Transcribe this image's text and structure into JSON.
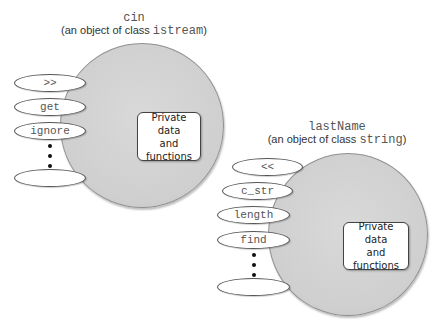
{
  "objects": [
    {
      "name": "cin",
      "subtitle_prefix": "(an object of class ",
      "class_name": "istream",
      "subtitle_suffix": ")",
      "methods": [
        ">>",
        "get",
        "ignore",
        ""
      ],
      "private_label": "Private data\nand\nfunctions"
    },
    {
      "name": "lastName",
      "subtitle_prefix": "(an object of class ",
      "class_name": "string",
      "subtitle_suffix": ")",
      "methods": [
        "<<",
        "c_str",
        "length",
        "find",
        ""
      ],
      "private_label": "Private data\nand\nfunctions"
    }
  ],
  "colors": {
    "circle_fill": "#d3d3d3",
    "circle_border": "#8f8f8f",
    "method_border": "#555555",
    "box_border": "#444444"
  }
}
